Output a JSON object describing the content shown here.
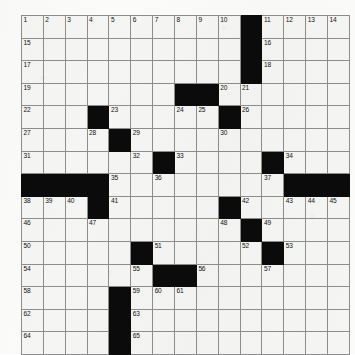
{
  "puzzle": {
    "title": "Crossword Grid",
    "rows": 15,
    "cols": 15,
    "colors": {
      "block": "#0b0b0b",
      "cell": "#f5f5f3",
      "gridline": "#8d8d8d",
      "number": "#111111",
      "page": "#fbfbfa"
    },
    "grid": [
      [
        {
          "n": "1",
          "b": false
        },
        {
          "n": "2",
          "b": false
        },
        {
          "n": "3",
          "b": false
        },
        {
          "n": "4",
          "b": false
        },
        {
          "n": "5",
          "b": false
        },
        {
          "n": "6",
          "b": false
        },
        {
          "n": "7",
          "b": false
        },
        {
          "n": "8",
          "b": false
        },
        {
          "n": "9",
          "b": false
        },
        {
          "n": "10",
          "b": false
        },
        {
          "n": "",
          "b": true
        },
        {
          "n": "11",
          "b": false
        },
        {
          "n": "12",
          "b": false
        },
        {
          "n": "13",
          "b": false
        },
        {
          "n": "14",
          "b": false
        }
      ],
      [
        {
          "n": "15",
          "b": false
        },
        {
          "n": "",
          "b": false
        },
        {
          "n": "",
          "b": false
        },
        {
          "n": "",
          "b": false
        },
        {
          "n": "",
          "b": false
        },
        {
          "n": "",
          "b": false
        },
        {
          "n": "",
          "b": false
        },
        {
          "n": "",
          "b": false
        },
        {
          "n": "",
          "b": false
        },
        {
          "n": "",
          "b": false
        },
        {
          "n": "",
          "b": true
        },
        {
          "n": "16",
          "b": false
        },
        {
          "n": "",
          "b": false
        },
        {
          "n": "",
          "b": false
        },
        {
          "n": "",
          "b": false
        }
      ],
      [
        {
          "n": "17",
          "b": false
        },
        {
          "n": "",
          "b": false
        },
        {
          "n": "",
          "b": false
        },
        {
          "n": "",
          "b": false
        },
        {
          "n": "",
          "b": false
        },
        {
          "n": "",
          "b": false
        },
        {
          "n": "",
          "b": false
        },
        {
          "n": "",
          "b": false
        },
        {
          "n": "",
          "b": false
        },
        {
          "n": "",
          "b": false
        },
        {
          "n": "",
          "b": true
        },
        {
          "n": "18",
          "b": false
        },
        {
          "n": "",
          "b": false
        },
        {
          "n": "",
          "b": false
        },
        {
          "n": "",
          "b": false
        }
      ],
      [
        {
          "n": "19",
          "b": false
        },
        {
          "n": "",
          "b": false
        },
        {
          "n": "",
          "b": false
        },
        {
          "n": "",
          "b": false
        },
        {
          "n": "",
          "b": false
        },
        {
          "n": "",
          "b": false
        },
        {
          "n": "",
          "b": false
        },
        {
          "n": "",
          "b": true
        },
        {
          "n": "",
          "b": true
        },
        {
          "n": "20",
          "b": false
        },
        {
          "n": "21",
          "b": false
        },
        {
          "n": "",
          "b": false
        },
        {
          "n": "",
          "b": false
        },
        {
          "n": "",
          "b": false
        },
        {
          "n": "",
          "b": false
        }
      ],
      [
        {
          "n": "22",
          "b": false
        },
        {
          "n": "",
          "b": false
        },
        {
          "n": "",
          "b": false
        },
        {
          "n": "",
          "b": true
        },
        {
          "n": "23",
          "b": false
        },
        {
          "n": "",
          "b": false
        },
        {
          "n": "",
          "b": false
        },
        {
          "n": "24",
          "b": false
        },
        {
          "n": "25",
          "b": false
        },
        {
          "n": "",
          "b": true
        },
        {
          "n": "26",
          "b": false
        },
        {
          "n": "",
          "b": false
        },
        {
          "n": "",
          "b": false
        },
        {
          "n": "",
          "b": false
        },
        {
          "n": "",
          "b": false
        }
      ],
      [
        {
          "n": "27",
          "b": false
        },
        {
          "n": "",
          "b": false
        },
        {
          "n": "",
          "b": false
        },
        {
          "n": "28",
          "b": false
        },
        {
          "n": "",
          "b": true
        },
        {
          "n": "29",
          "b": false
        },
        {
          "n": "",
          "b": false
        },
        {
          "n": "",
          "b": false
        },
        {
          "n": "",
          "b": false
        },
        {
          "n": "30",
          "b": false
        },
        {
          "n": "",
          "b": false
        },
        {
          "n": "",
          "b": false
        },
        {
          "n": "",
          "b": false
        },
        {
          "n": "",
          "b": false
        },
        {
          "n": "",
          "b": false
        }
      ],
      [
        {
          "n": "31",
          "b": false
        },
        {
          "n": "",
          "b": false
        },
        {
          "n": "",
          "b": false
        },
        {
          "n": "",
          "b": false
        },
        {
          "n": "",
          "b": false
        },
        {
          "n": "32",
          "b": false
        },
        {
          "n": "",
          "b": true
        },
        {
          "n": "33",
          "b": false
        },
        {
          "n": "",
          "b": false
        },
        {
          "n": "",
          "b": false
        },
        {
          "n": "",
          "b": false
        },
        {
          "n": "",
          "b": true
        },
        {
          "n": "34",
          "b": false
        },
        {
          "n": "",
          "b": false
        },
        {
          "n": "",
          "b": false
        }
      ],
      [
        {
          "n": "",
          "b": true
        },
        {
          "n": "",
          "b": true
        },
        {
          "n": "",
          "b": true
        },
        {
          "n": "",
          "b": true
        },
        {
          "n": "35",
          "b": false
        },
        {
          "n": "",
          "b": false
        },
        {
          "n": "36",
          "b": false
        },
        {
          "n": "",
          "b": false
        },
        {
          "n": "",
          "b": false
        },
        {
          "n": "",
          "b": false
        },
        {
          "n": "",
          "b": false
        },
        {
          "n": "37",
          "b": false
        },
        {
          "n": "",
          "b": true
        },
        {
          "n": "",
          "b": true
        },
        {
          "n": "",
          "b": true
        }
      ],
      [
        {
          "n": "38",
          "b": false
        },
        {
          "n": "39",
          "b": false
        },
        {
          "n": "40",
          "b": false
        },
        {
          "n": "",
          "b": true
        },
        {
          "n": "41",
          "b": false
        },
        {
          "n": "",
          "b": false
        },
        {
          "n": "",
          "b": false
        },
        {
          "n": "",
          "b": false
        },
        {
          "n": "",
          "b": false
        },
        {
          "n": "",
          "b": true
        },
        {
          "n": "42",
          "b": false
        },
        {
          "n": "",
          "b": false
        },
        {
          "n": "43",
          "b": false
        },
        {
          "n": "44",
          "b": false
        },
        {
          "n": "45",
          "b": false
        }
      ],
      [
        {
          "n": "46",
          "b": false
        },
        {
          "n": "",
          "b": false
        },
        {
          "n": "",
          "b": false
        },
        {
          "n": "47",
          "b": false
        },
        {
          "n": "",
          "b": false
        },
        {
          "n": "",
          "b": false
        },
        {
          "n": "",
          "b": false
        },
        {
          "n": "",
          "b": false
        },
        {
          "n": "",
          "b": false
        },
        {
          "n": "48",
          "b": false
        },
        {
          "n": "",
          "b": true
        },
        {
          "n": "49",
          "b": false
        },
        {
          "n": "",
          "b": false
        },
        {
          "n": "",
          "b": false
        },
        {
          "n": "",
          "b": false
        }
      ],
      [
        {
          "n": "50",
          "b": false
        },
        {
          "n": "",
          "b": false
        },
        {
          "n": "",
          "b": false
        },
        {
          "n": "",
          "b": false
        },
        {
          "n": "",
          "b": false
        },
        {
          "n": "",
          "b": true
        },
        {
          "n": "51",
          "b": false
        },
        {
          "n": "",
          "b": false
        },
        {
          "n": "",
          "b": false
        },
        {
          "n": "",
          "b": false
        },
        {
          "n": "52",
          "b": false
        },
        {
          "n": "",
          "b": true
        },
        {
          "n": "53",
          "b": false
        },
        {
          "n": "",
          "b": false
        },
        {
          "n": "",
          "b": false
        }
      ],
      [
        {
          "n": "54",
          "b": false
        },
        {
          "n": "",
          "b": false
        },
        {
          "n": "",
          "b": false
        },
        {
          "n": "",
          "b": false
        },
        {
          "n": "",
          "b": false
        },
        {
          "n": "55",
          "b": false
        },
        {
          "n": "",
          "b": true
        },
        {
          "n": "",
          "b": true
        },
        {
          "n": "56",
          "b": false
        },
        {
          "n": "",
          "b": false
        },
        {
          "n": "",
          "b": false
        },
        {
          "n": "57",
          "b": false
        },
        {
          "n": "",
          "b": false
        },
        {
          "n": "",
          "b": false
        },
        {
          "n": "",
          "b": false
        }
      ],
      [
        {
          "n": "58",
          "b": false
        },
        {
          "n": "",
          "b": false
        },
        {
          "n": "",
          "b": false
        },
        {
          "n": "",
          "b": false
        },
        {
          "n": "",
          "b": true
        },
        {
          "n": "59",
          "b": false
        },
        {
          "n": "60",
          "b": false
        },
        {
          "n": "61",
          "b": false
        },
        {
          "n": "",
          "b": false
        },
        {
          "n": "",
          "b": false
        },
        {
          "n": "",
          "b": false
        },
        {
          "n": "",
          "b": false
        },
        {
          "n": "",
          "b": false
        },
        {
          "n": "",
          "b": false
        },
        {
          "n": "",
          "b": false
        }
      ],
      [
        {
          "n": "62",
          "b": false
        },
        {
          "n": "",
          "b": false
        },
        {
          "n": "",
          "b": false
        },
        {
          "n": "",
          "b": false
        },
        {
          "n": "",
          "b": true
        },
        {
          "n": "63",
          "b": false
        },
        {
          "n": "",
          "b": false
        },
        {
          "n": "",
          "b": false
        },
        {
          "n": "",
          "b": false
        },
        {
          "n": "",
          "b": false
        },
        {
          "n": "",
          "b": false
        },
        {
          "n": "",
          "b": false
        },
        {
          "n": "",
          "b": false
        },
        {
          "n": "",
          "b": false
        },
        {
          "n": "",
          "b": false
        }
      ],
      [
        {
          "n": "64",
          "b": false
        },
        {
          "n": "",
          "b": false
        },
        {
          "n": "",
          "b": false
        },
        {
          "n": "",
          "b": false
        },
        {
          "n": "",
          "b": true
        },
        {
          "n": "65",
          "b": false
        },
        {
          "n": "",
          "b": false
        },
        {
          "n": "",
          "b": false
        },
        {
          "n": "",
          "b": false
        },
        {
          "n": "",
          "b": false
        },
        {
          "n": "",
          "b": false
        },
        {
          "n": "",
          "b": false
        },
        {
          "n": "",
          "b": false
        },
        {
          "n": "",
          "b": false
        },
        {
          "n": "",
          "b": false
        }
      ]
    ]
  }
}
